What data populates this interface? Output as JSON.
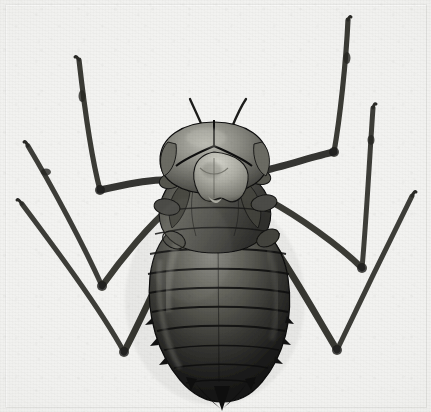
{
  "image": {
    "kind": "photographic-plate",
    "medium": "black-and-white halftone photograph",
    "subject": "dragonfly nymph (naiad), dorsal view",
    "caption": "",
    "width_px": 431,
    "height_px": 412,
    "orientation": "head at top, abdomen tip at bottom"
  },
  "palette": {
    "paper_light": "#f6f6f4",
    "paper_mid": "#eaeae7",
    "paper_edge": "#e3e3e0",
    "body_darkest": "#141414",
    "body_dark": "#272726",
    "body_mid": "#4e4e4b",
    "body_light": "#8e8e88",
    "highlight": "#c8c8c0",
    "leg_dark": "#2e2e2c",
    "leg_mid": "#5a5a56",
    "outline": "#101010"
  },
  "subject_parts": [
    {
      "name": "head",
      "label": "head capsule with labial mask",
      "center_x": 213,
      "center_y": 150
    },
    {
      "name": "antenna-left",
      "label": "left antenna",
      "tip_x": 190,
      "tip_y": 100
    },
    {
      "name": "antenna-right",
      "label": "right antenna",
      "tip_x": 246,
      "tip_y": 100
    },
    {
      "name": "labial-mask",
      "label": "triangular labial mask (prementum)",
      "center_x": 217,
      "center_y": 182
    },
    {
      "name": "thorax",
      "label": "thorax with wing pads",
      "center_x": 215,
      "center_y": 215
    },
    {
      "name": "abdomen",
      "label": "segmented abdomen",
      "center_x": 217,
      "center_y": 300
    },
    {
      "name": "abdomen-tip",
      "label": "terminal appendages (cerci and epiproct)",
      "center_x": 222,
      "center_y": 396
    }
  ],
  "abdomen": {
    "segment_count": 9,
    "segment_boundaries_y": [
      232,
      252,
      272,
      291,
      310,
      329,
      348,
      366,
      382
    ]
  },
  "legs": [
    {
      "name": "leg-front-left",
      "side": "left",
      "pair": "front",
      "tip_x": 78,
      "tip_y": 58,
      "knee_x": 96,
      "knee_y": 190,
      "attach_x": 176,
      "attach_y": 178
    },
    {
      "name": "leg-middle-left",
      "side": "left",
      "pair": "middle",
      "tip_x": 26,
      "tip_y": 142,
      "knee_x": 100,
      "knee_y": 285,
      "attach_x": 170,
      "attach_y": 205
    },
    {
      "name": "leg-hind-left",
      "side": "left",
      "pair": "hind",
      "tip_x": 19,
      "tip_y": 200,
      "knee_x": 122,
      "knee_y": 352,
      "attach_x": 175,
      "attach_y": 245
    },
    {
      "name": "leg-front-right",
      "side": "right",
      "pair": "front",
      "tip_x": 348,
      "tip_y": 17,
      "knee_x": 334,
      "knee_y": 152,
      "attach_x": 258,
      "attach_y": 170
    },
    {
      "name": "leg-middle-right",
      "side": "right",
      "pair": "middle",
      "tip_x": 372,
      "tip_y": 104,
      "knee_x": 362,
      "knee_y": 268,
      "attach_x": 268,
      "attach_y": 200
    },
    {
      "name": "leg-hind-right",
      "side": "right",
      "pair": "hind",
      "tip_x": 412,
      "tip_y": 190,
      "knee_x": 337,
      "knee_y": 348,
      "attach_x": 272,
      "attach_y": 243
    }
  ]
}
